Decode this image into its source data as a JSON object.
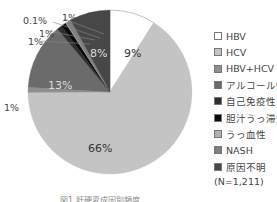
{
  "chart_data": {
    "type": "pie",
    "title": "",
    "slices": [
      {
        "label": "HBV",
        "value": 9,
        "display": "9%",
        "color": "#ffffff"
      },
      {
        "label": "HCV",
        "value": 66,
        "display": "66%",
        "color": "#c4c4c4"
      },
      {
        "label": "HBV+HCV",
        "value": 1,
        "display": "1%",
        "color": "#8f8f8f"
      },
      {
        "label": "アルコール性",
        "value": 13,
        "display": "13%",
        "color": "#6b6b6b"
      },
      {
        "label": "自己免疫性",
        "value": 1,
        "display": "1%",
        "color": "#2e2e2e"
      },
      {
        "label": "胆汁うっ滞型",
        "value": 1,
        "display": "1%",
        "color": "#0a0a0a"
      },
      {
        "label": "うっ血性",
        "value": 0.1,
        "display": "0.1%",
        "color": "#b0b0b0"
      },
      {
        "label": "NASH",
        "value": 1,
        "display": "1%",
        "color": "#808080"
      },
      {
        "label": "原因不明",
        "value": 8,
        "display": "8%",
        "color": "#474747"
      }
    ],
    "legend_position": "right",
    "note": "(N=1,211)"
  },
  "legend": {
    "items": [
      {
        "label": "HBV",
        "color": "#ffffff"
      },
      {
        "label": "HCV",
        "color": "#c4c4c4"
      },
      {
        "label": "HBV+HCV",
        "color": "#8f8f8f"
      },
      {
        "label": "アルコール性",
        "color": "#6b6b6b"
      },
      {
        "label": "自己免疫性",
        "color": "#2e2e2e"
      },
      {
        "label": "胆汁うっ滞型",
        "color": "#0a0a0a"
      },
      {
        "label": "うっ血性",
        "color": "#b0b0b0"
      },
      {
        "label": "NASH",
        "color": "#808080"
      },
      {
        "label": "原因不明",
        "color": "#474747"
      }
    ],
    "n_label": "(N=1,211)"
  },
  "labels": {
    "hbv": "9%",
    "hcv": "66%",
    "hbv_hcv": "1%",
    "alcohol": "13%",
    "autoimmune": "1%",
    "biliary": "1%",
    "congestive": "0.1%",
    "nash": "1%",
    "unknown": "8%"
  },
  "caption": "図1 肝硬変成因別頻度"
}
